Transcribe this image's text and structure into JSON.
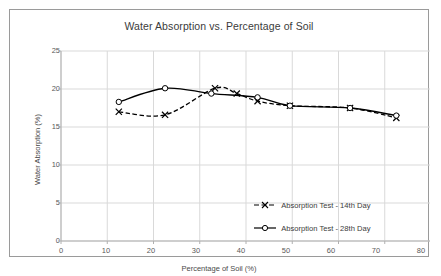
{
  "chart_data": {
    "type": "line",
    "title": "Water Absorption vs. Percentage of Soil",
    "xlabel": "Percentage of Soil (%)",
    "ylabel": "Water Absorption (%)",
    "xlim": [
      0,
      80
    ],
    "ylim": [
      0,
      25
    ],
    "xticks": [
      0,
      10,
      20,
      30,
      40,
      50,
      60,
      70,
      80
    ],
    "yticks": [
      0,
      5,
      10,
      15,
      20,
      25
    ],
    "grid": "horizontal-and-vertical",
    "legend_position": "inside-lower-right",
    "series": [
      {
        "name": "Absorption Test - 14th Day",
        "marker": "x",
        "line_style": "dashed",
        "color": "#000000",
        "points": [
          {
            "x": 12.5,
            "y": 17.0
          },
          {
            "x": 22.5,
            "y": 16.6
          },
          {
            "x": 33.3,
            "y": 20.1
          },
          {
            "x": 38.0,
            "y": 19.4
          },
          {
            "x": 42.5,
            "y": 18.4
          },
          {
            "x": 49.5,
            "y": 17.8
          },
          {
            "x": 62.5,
            "y": 17.5
          },
          {
            "x": 72.5,
            "y": 16.2
          }
        ]
      },
      {
        "name": "Absorption Test - 28th Day",
        "marker": "circle",
        "line_style": "solid",
        "color": "#000000",
        "points": [
          {
            "x": 12.5,
            "y": 18.3
          },
          {
            "x": 22.5,
            "y": 20.1
          },
          {
            "x": 32.5,
            "y": 19.4
          },
          {
            "x": 42.5,
            "y": 18.9
          },
          {
            "x": 49.5,
            "y": 17.8
          },
          {
            "x": 62.5,
            "y": 17.5
          },
          {
            "x": 72.5,
            "y": 16.5
          }
        ]
      }
    ]
  },
  "axis": {
    "y_tick_labels": [
      "25",
      "20",
      "15",
      "10",
      "5",
      "0"
    ],
    "x_tick_labels": [
      "0",
      "10",
      "20",
      "30",
      "40",
      "50",
      "60",
      "70",
      "80"
    ]
  },
  "legend": {
    "items": [
      {
        "label": "Absorption Test - 14th Day"
      },
      {
        "label": "Absorption Test - 28th Day"
      }
    ]
  },
  "colors": {
    "line": "#000000",
    "grid": "#d9d9d9",
    "axis": "#b0b0b0",
    "text": "#404040",
    "border": "#9a9a9a"
  }
}
